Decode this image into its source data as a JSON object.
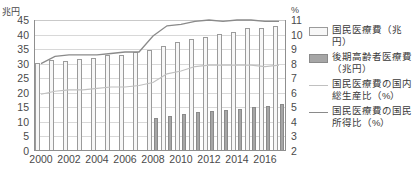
{
  "axes": {
    "left_unit": "兆円",
    "right_unit": "%",
    "left_ticks": [
      "45",
      "40",
      "35",
      "30",
      "25",
      "20",
      "15",
      "10",
      "5",
      "0"
    ],
    "right_ticks": [
      "11",
      "10",
      "9",
      "8",
      "7",
      "6",
      "5",
      "4",
      "3",
      "2"
    ],
    "x_ticks": [
      "2000",
      "2002",
      "2004",
      "2006",
      "2008",
      "2010",
      "2012",
      "2014",
      "2016"
    ]
  },
  "legend": {
    "items": [
      {
        "key": "bar-total",
        "label": "国民医療費（兆円）"
      },
      {
        "key": "bar-elderly",
        "label": "後期高齢者医療費（兆円）"
      },
      {
        "key": "line-gdp",
        "label": "国民医療費の国内総生産比（%）"
      },
      {
        "key": "line-income",
        "label": "国民医療費の国民所得比（%）"
      }
    ]
  },
  "colors": {
    "bar_total_fill": "#f7f7f7",
    "bar_total_stroke": "#9b9b9b",
    "bar_elderly_fill": "#a6a6a6",
    "bar_elderly_stroke": "#8a8a8a",
    "line_gdp": "#c0c0c0",
    "line_income": "#8a8a8a",
    "grid": "#d8d8d8",
    "axis": "#8f8f8f",
    "text": "#3a3a3a"
  },
  "chart_data": {
    "type": "bar",
    "title": "",
    "xlabel": "",
    "ylabel": "兆円",
    "y2label": "%",
    "ylim": [
      0,
      45
    ],
    "y2lim": [
      2,
      11
    ],
    "grid": true,
    "legend_position": "right",
    "categories": [
      "2000",
      "2001",
      "2002",
      "2003",
      "2004",
      "2005",
      "2006",
      "2007",
      "2008",
      "2009",
      "2010",
      "2011",
      "2012",
      "2013",
      "2014",
      "2015",
      "2016",
      "2017"
    ],
    "series": [
      {
        "name": "国民医療費（兆円）",
        "type": "bar",
        "axis": "left",
        "values": [
          30.1,
          31.1,
          31.0,
          31.5,
          32.1,
          33.1,
          33.1,
          34.1,
          34.8,
          36.0,
          37.4,
          38.6,
          39.2,
          40.1,
          40.8,
          42.4,
          42.1,
          43.1
        ]
      },
      {
        "name": "後期高齢者医療費（兆円）",
        "type": "bar",
        "axis": "left",
        "values": [
          null,
          null,
          null,
          null,
          null,
          null,
          null,
          null,
          11.4,
          12.0,
          12.7,
          13.3,
          13.7,
          14.2,
          14.5,
          15.1,
          15.3,
          16.0
        ]
      },
      {
        "name": "国民医療費の国内総生産比（%）",
        "type": "line",
        "axis": "right",
        "values": [
          5.9,
          6.1,
          6.2,
          6.2,
          6.3,
          6.4,
          6.4,
          6.5,
          6.7,
          7.3,
          7.5,
          7.8,
          7.9,
          7.9,
          7.9,
          7.9,
          7.8,
          7.9
        ]
      },
      {
        "name": "国民医療費の国民所得比（%）",
        "type": "line",
        "axis": "right",
        "values": [
          8.0,
          8.5,
          8.6,
          8.6,
          8.6,
          8.7,
          8.8,
          8.8,
          9.9,
          10.6,
          10.7,
          10.9,
          11.0,
          10.9,
          11.0,
          11.0,
          10.9,
          10.9
        ]
      }
    ]
  }
}
